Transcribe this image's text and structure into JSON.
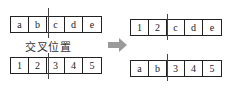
{
  "before": {
    "top": [
      "a",
      "b",
      "c",
      "d",
      "e"
    ],
    "bottom": [
      "1",
      "2",
      "3",
      "4",
      "5"
    ],
    "crossover_label": "交叉位置"
  },
  "after": {
    "top": [
      "1",
      "2",
      "c",
      "d",
      "e"
    ],
    "bottom": [
      "a",
      "b",
      "3",
      "4",
      "5"
    ]
  },
  "colors": {
    "arrow": "#9a9a9a",
    "line": "#222222"
  }
}
